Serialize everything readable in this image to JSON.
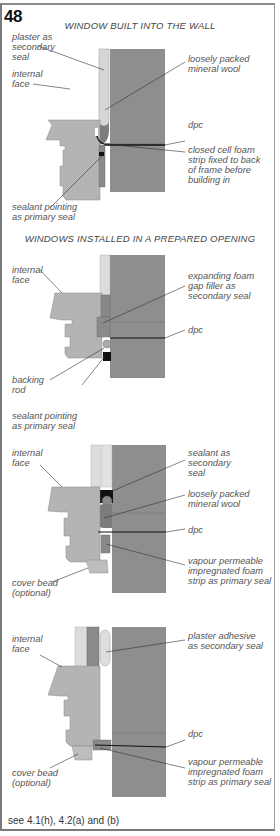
{
  "figure": {
    "number": "48",
    "caption": "see 4.1(h), 4.2(a) and (b)"
  },
  "colors": {
    "wall": "#8e8e8e",
    "frame": "#b4b4b4",
    "plaster": "#d6d6d6",
    "wool": "#7c7c7c",
    "sealant": "#111111",
    "leader": "#333333",
    "text": "#555555"
  },
  "sections": [
    {
      "heading": "WINDOW BUILT INTO THE WALL",
      "labels": {
        "plaster": "plaster  as\nsecondary\nseal",
        "internal_face": "internal\nface",
        "wool": "loosely packed\nmineral wool",
        "dpc": "dpc",
        "foam_strip": "closed cell foam\nstrip fixed to back\nof frame before\nbuilding in",
        "sealant": "sealant pointing\nas primary seal"
      }
    },
    {
      "heading": "WINDOWS INSTALLED IN A PREPARED OPENING",
      "labels": {
        "internal_face": "internal\nface",
        "foam_filler": "expanding foam\ngap filler as\nsecondary seal",
        "dpc": "dpc",
        "backing_rod": "backing\nrod",
        "sealant": "sealant pointing\nas primary seal"
      }
    },
    {
      "heading": "",
      "labels": {
        "internal_face": "internal\nface",
        "sealant": "sealant as\nsecondary\nseal",
        "wool": "loosely packed\nmineral wool",
        "dpc": "dpc",
        "vapour": "vapour permeable\nimpregnated foam\nstrip as primary seal",
        "cover_bead": "cover bead\n(optional)"
      }
    },
    {
      "heading": "",
      "labels": {
        "internal_face": "internal\nface",
        "plaster_adhesive": "plaster adhesive\nas secondary seal",
        "dpc": "dpc",
        "vapour": "vapour permeable\nimpregnated foam\nstrip as primary seal",
        "cover_bead": "cover bead\n(optional)"
      }
    }
  ]
}
